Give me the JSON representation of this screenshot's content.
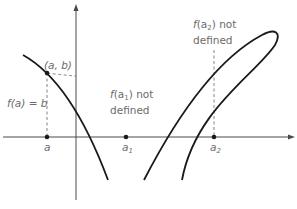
{
  "figure": {
    "colors": {
      "curve": "#1a1a1a",
      "axis": "#4a4a4a",
      "dashed": "#777777",
      "label": "#6b6b6b"
    },
    "labels": {
      "point_ab": "(a, b)",
      "fa_eq_b": "f(a) = b",
      "x_a": "a",
      "x_a1": "a",
      "x_a1_sub": "1",
      "x_a2": "a",
      "x_a2_sub": "2",
      "fa1_not_defined_f": "f",
      "fa1_not_defined_arg": "(a",
      "fa1_sub": "1",
      "fa1_rest": ") not",
      "fa1_line2": "defined",
      "fa2_not_defined_f": "f",
      "fa2_not_defined_arg": "(a",
      "fa2_sub": "2",
      "fa2_rest": ") not",
      "fa2_line2": "defined"
    },
    "points": {
      "ab": {
        "x": 47,
        "y": 73
      },
      "a": {
        "x": 47,
        "y": 137
      },
      "a1": {
        "x": 126,
        "y": 137
      },
      "a2": {
        "x": 214,
        "y": 137
      }
    }
  }
}
